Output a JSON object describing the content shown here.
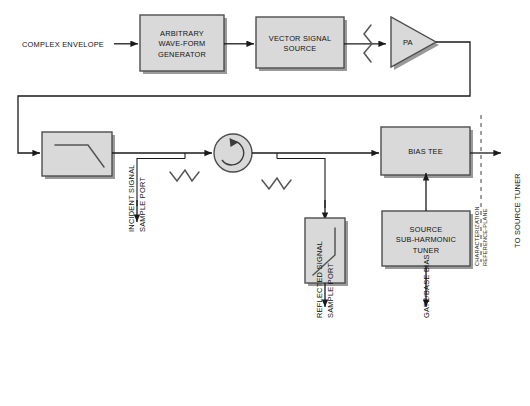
{
  "diagram": {
    "colors": {
      "block_fill": "#d9d9d9",
      "block_stroke": "#4d4d4d",
      "wire": "#1a1a1a",
      "symbol": "#555555",
      "reference_plane": "#555555",
      "background": "#ffffff"
    },
    "blocks": [
      {
        "id": "awg",
        "label_line1": "ARBITRARY",
        "label_line2": "WAVE-FORM",
        "label_line3": "GENERATOR"
      },
      {
        "id": "vss",
        "label_line1": "VECTOR SIGNAL",
        "label_line2": "SOURCE"
      },
      {
        "id": "pa",
        "label": "PA"
      },
      {
        "id": "lpf-incident",
        "label": ""
      },
      {
        "id": "circulator",
        "label": ""
      },
      {
        "id": "lpf-reflected",
        "label": ""
      },
      {
        "id": "bias-tee",
        "label": "BIAS TEE"
      },
      {
        "id": "source-tuner",
        "label_line1": "SOURCE",
        "label_line2": "SUB-HARMONIC",
        "label_line3": "TUNER"
      }
    ],
    "labels": {
      "complex_envelope": "COMPLEX ENVELOPE",
      "incident_port_line1": "INCIDENT SIGNAL",
      "incident_port_line2": "SAMPLE PORT",
      "reflected_port_line1": "REFLECTED SIGNAL",
      "reflected_port_line2": "SAMPLE PORT",
      "gate_base_bias": "GATE/BASE BIAS",
      "to_source_tuner": "TO SOURCE TUNER",
      "reference_plane_line1": "CHARACTERIZATION",
      "reference_plane_line2": "REFERENCE-PLANE"
    },
    "icons": {
      "arrowhead": "arrowhead-icon",
      "lowpass_filter": "lowpass-filter-icon",
      "circulator": "circulator-icon",
      "coupler": "directional-coupler-zigzag-icon",
      "attenuator": "attenuator-zigzag-icon",
      "amplifier": "amplifier-triangle-icon",
      "reference_plane": "dashed-reference-plane-icon"
    }
  }
}
